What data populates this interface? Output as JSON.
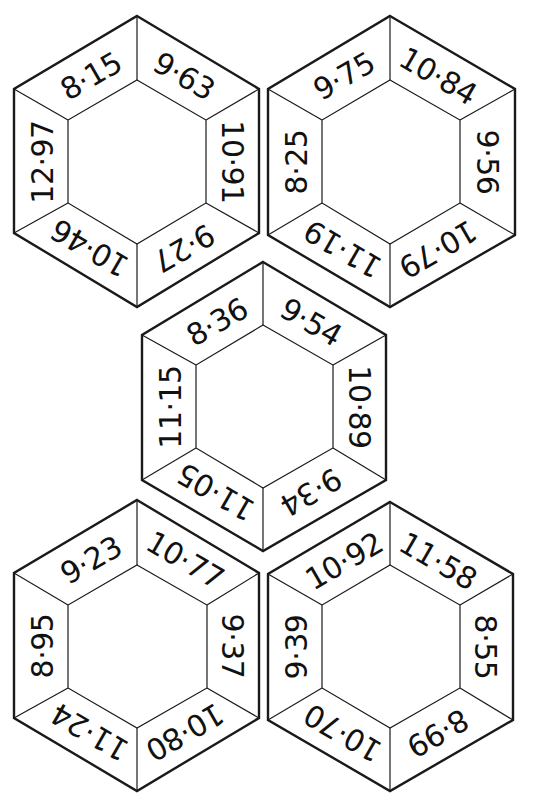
{
  "puzzle": {
    "description": "Hexagon decimal puzzle sheet",
    "hexagons": [
      {
        "id": "hex-top-left",
        "values": {
          "top_left": "8·15",
          "top_right": "9·63",
          "right": "10·91",
          "bottom_right": "9·27",
          "bottom_left": "10·46",
          "left": "12·97"
        }
      },
      {
        "id": "hex-top-right",
        "values": {
          "top_left": "9·75",
          "top_right": "10·84",
          "right": "9·56",
          "bottom_right": "10·79",
          "bottom_left": "11·19",
          "left": "8·25"
        }
      },
      {
        "id": "hex-center",
        "values": {
          "top_left": "8·36",
          "top_right": "9·54",
          "right": "10·89",
          "bottom_right": "9·34",
          "bottom_left": "11·05",
          "left": "11·15"
        }
      },
      {
        "id": "hex-bottom-left",
        "values": {
          "top_left": "9·23",
          "top_right": "10·77",
          "right": "9·37",
          "bottom_right": "10·80",
          "bottom_left": "11·24",
          "left": "8·95"
        }
      },
      {
        "id": "hex-bottom-right",
        "values": {
          "top_left": "10·92",
          "top_right": "11·58",
          "right": "8·55",
          "bottom_right": "8·99",
          "bottom_left": "10·70",
          "left": "9·39"
        }
      }
    ]
  },
  "colors": {
    "line": "#1a1a1a",
    "text": "#111111",
    "background": "#ffffff"
  }
}
